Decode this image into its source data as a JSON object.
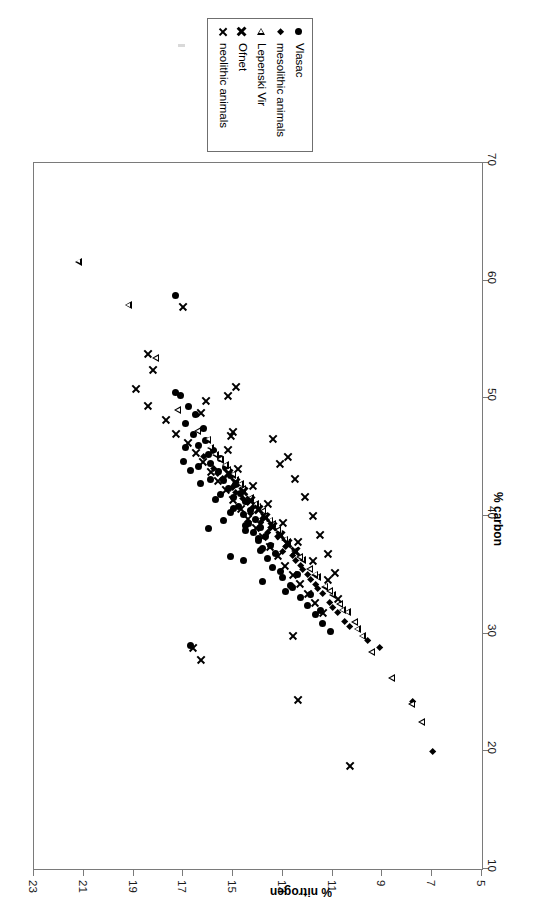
{
  "legend": {
    "position": "top-center-rotated",
    "entries": [
      {
        "label": "Vlasac",
        "marker": "circle-filled"
      },
      {
        "label": "mesolithic animals",
        "marker": "diamond-filled"
      },
      {
        "label": "Lepenski Vir",
        "marker": "triangle-open-left"
      },
      {
        "label": "Ofnet",
        "marker": "x-bold"
      },
      {
        "label": "neolithic animals",
        "marker": "x-thin"
      }
    ]
  },
  "axes": {
    "carbon": {
      "title": "% carbon",
      "ticks": [
        10,
        20,
        30,
        40,
        50,
        60,
        70
      ],
      "min": 10,
      "max": 70
    },
    "nitrogen": {
      "title": "% nitrogen",
      "ticks": [
        5,
        7,
        9,
        11,
        13,
        15,
        17,
        19,
        21,
        23
      ],
      "min": 5,
      "max": 23
    }
  },
  "colors": {
    "marker": "#000000",
    "frame": "#7a7a7a",
    "background": "#ffffff",
    "text": "#000000"
  },
  "chart_data": {
    "type": "scatter",
    "title": "",
    "xlabel": "% carbon",
    "ylabel": "% nitrogen",
    "xlim": [
      10,
      70
    ],
    "ylim": [
      5,
      23
    ],
    "grid": false,
    "orientation": "rotated-90-in-page",
    "legend_position": "top",
    "series": [
      {
        "name": "Vlasac",
        "marker": "circle-filled",
        "points": [
          [
            58.7,
            17.3
          ],
          [
            50.5,
            17.3
          ],
          [
            50.2,
            17.1
          ],
          [
            49.3,
            16.8
          ],
          [
            48.6,
            16.5
          ],
          [
            47.9,
            16.9
          ],
          [
            47.4,
            16.2
          ],
          [
            46.9,
            16.6
          ],
          [
            46.4,
            16.1
          ],
          [
            46.0,
            16.4
          ],
          [
            45.6,
            15.8
          ],
          [
            45.2,
            16.0
          ],
          [
            44.9,
            15.5
          ],
          [
            44.5,
            15.9
          ],
          [
            44.1,
            15.3
          ],
          [
            43.8,
            15.6
          ],
          [
            43.4,
            15.1
          ],
          [
            43.0,
            15.4
          ],
          [
            42.7,
            14.9
          ],
          [
            42.3,
            15.2
          ],
          [
            41.9,
            14.7
          ],
          [
            41.6,
            15.0
          ],
          [
            41.2,
            14.5
          ],
          [
            40.8,
            14.8
          ],
          [
            40.5,
            14.3
          ],
          [
            40.1,
            14.6
          ],
          [
            39.7,
            14.1
          ],
          [
            39.4,
            14.4
          ],
          [
            39.0,
            13.9
          ],
          [
            38.6,
            14.2
          ],
          [
            38.3,
            13.7
          ],
          [
            37.9,
            14.0
          ],
          [
            37.5,
            13.5
          ],
          [
            37.2,
            13.8
          ],
          [
            36.8,
            13.3
          ],
          [
            44.6,
            17.0
          ],
          [
            43.9,
            16.7
          ],
          [
            42.8,
            16.3
          ],
          [
            41.4,
            15.7
          ],
          [
            40.3,
            15.1
          ],
          [
            38.8,
            14.5
          ],
          [
            37.1,
            13.9
          ],
          [
            35.6,
            13.4
          ],
          [
            34.8,
            13.0
          ],
          [
            33.9,
            12.6
          ],
          [
            33.1,
            12.3
          ],
          [
            32.4,
            12.0
          ],
          [
            31.6,
            11.7
          ],
          [
            30.9,
            11.4
          ],
          [
            30.2,
            11.1
          ],
          [
            29.0,
            16.7
          ],
          [
            38.9,
            16.0
          ],
          [
            39.6,
            15.4
          ],
          [
            36.6,
            15.1
          ],
          [
            36.2,
            14.6
          ],
          [
            34.4,
            13.8
          ],
          [
            33.6,
            12.9
          ],
          [
            35.0,
            12.4
          ],
          [
            33.3,
            11.9
          ],
          [
            32.0,
            11.5
          ],
          [
            45.8,
            16.9
          ],
          [
            44.2,
            16.4
          ],
          [
            43.1,
            15.9
          ],
          [
            41.8,
            15.5
          ],
          [
            40.6,
            15.0
          ],
          [
            39.2,
            14.5
          ],
          [
            38.1,
            14.0
          ],
          [
            36.4,
            13.6
          ],
          [
            35.3,
            13.1
          ],
          [
            34.1,
            12.7
          ]
        ]
      },
      {
        "name": "mesolithic animals",
        "marker": "diamond-filled",
        "points": [
          [
            45.0,
            16.2
          ],
          [
            44.0,
            15.8
          ],
          [
            43.2,
            15.4
          ],
          [
            42.4,
            15.0
          ],
          [
            41.5,
            14.6
          ],
          [
            40.7,
            14.2
          ],
          [
            39.8,
            13.8
          ],
          [
            39.0,
            13.5
          ],
          [
            38.2,
            13.2
          ],
          [
            37.4,
            12.9
          ],
          [
            36.6,
            12.6
          ],
          [
            35.8,
            12.3
          ],
          [
            35.0,
            12.0
          ],
          [
            34.2,
            11.7
          ],
          [
            33.4,
            11.4
          ],
          [
            32.6,
            11.1
          ],
          [
            31.8,
            10.8
          ],
          [
            31.0,
            10.5
          ],
          [
            29.4,
            9.6
          ],
          [
            28.8,
            9.1
          ],
          [
            24.2,
            7.8
          ],
          [
            20.0,
            7.0
          ],
          [
            42.0,
            14.9
          ],
          [
            40.2,
            14.3
          ],
          [
            38.6,
            13.6
          ],
          [
            37.0,
            13.0
          ],
          [
            35.4,
            12.2
          ],
          [
            33.8,
            11.6
          ],
          [
            32.2,
            11.0
          ],
          [
            30.6,
            10.3
          ],
          [
            43.6,
            15.6
          ],
          [
            41.1,
            14.4
          ],
          [
            39.4,
            13.9
          ],
          [
            36.2,
            12.5
          ],
          [
            34.6,
            11.9
          ]
        ]
      },
      {
        "name": "Lepenski Vir",
        "marker": "triangle-open-left",
        "points": [
          [
            61.6,
            21.2
          ],
          [
            57.9,
            19.2
          ],
          [
            53.4,
            18.1
          ],
          [
            49.0,
            17.2
          ],
          [
            47.2,
            16.4
          ],
          [
            45.8,
            15.9
          ],
          [
            44.8,
            15.5
          ],
          [
            43.9,
            15.2
          ],
          [
            43.1,
            14.9
          ],
          [
            42.3,
            14.6
          ],
          [
            41.5,
            14.3
          ],
          [
            40.8,
            14.0
          ],
          [
            40.0,
            13.7
          ],
          [
            39.3,
            13.4
          ],
          [
            38.5,
            13.1
          ],
          [
            37.8,
            12.8
          ],
          [
            37.0,
            12.5
          ],
          [
            36.3,
            12.2
          ],
          [
            35.5,
            11.9
          ],
          [
            34.8,
            11.6
          ],
          [
            34.0,
            11.3
          ],
          [
            33.3,
            11.0
          ],
          [
            32.5,
            10.7
          ],
          [
            31.8,
            10.4
          ],
          [
            31.0,
            10.1
          ],
          [
            29.8,
            9.8
          ],
          [
            28.4,
            9.4
          ],
          [
            26.2,
            8.6
          ],
          [
            24.0,
            7.8
          ],
          [
            22.5,
            7.4
          ],
          [
            44.3,
            15.3
          ],
          [
            42.7,
            14.7
          ],
          [
            41.0,
            14.1
          ],
          [
            39.6,
            13.5
          ],
          [
            38.0,
            12.9
          ],
          [
            36.5,
            12.3
          ],
          [
            35.0,
            11.7
          ],
          [
            33.6,
            11.1
          ],
          [
            32.0,
            10.6
          ],
          [
            30.4,
            10.0
          ],
          [
            46.5,
            16.0
          ],
          [
            45.2,
            15.7
          ],
          [
            43.5,
            15.0
          ],
          [
            40.4,
            13.8
          ],
          [
            38.8,
            13.2
          ]
        ]
      },
      {
        "name": "Ofnet",
        "marker": "x-bold",
        "points": [
          [
            43.6,
            15.2
          ],
          [
            42.9,
            14.9
          ],
          [
            42.1,
            14.6
          ],
          [
            41.3,
            14.3
          ],
          [
            40.6,
            14.0
          ],
          [
            39.9,
            13.7
          ],
          [
            39.1,
            13.4
          ],
          [
            38.4,
            13.1
          ],
          [
            37.7,
            12.8
          ],
          [
            37.0,
            12.5
          ]
        ]
      },
      {
        "name": "neolithic animals",
        "marker": "x-thin",
        "points": [
          [
            57.8,
            17.0
          ],
          [
            53.8,
            18.4
          ],
          [
            52.4,
            18.2
          ],
          [
            50.8,
            18.9
          ],
          [
            49.4,
            18.4
          ],
          [
            48.2,
            17.7
          ],
          [
            47.0,
            17.3
          ],
          [
            46.2,
            16.8
          ],
          [
            45.4,
            16.5
          ],
          [
            44.6,
            16.2
          ],
          [
            43.8,
            15.9
          ],
          [
            43.0,
            15.6
          ],
          [
            42.2,
            15.3
          ],
          [
            41.4,
            15.0
          ],
          [
            40.6,
            14.7
          ],
          [
            39.8,
            14.4
          ],
          [
            39.0,
            14.1
          ],
          [
            38.2,
            13.8
          ],
          [
            37.4,
            13.5
          ],
          [
            36.6,
            13.2
          ],
          [
            35.8,
            12.9
          ],
          [
            35.0,
            12.6
          ],
          [
            34.2,
            12.3
          ],
          [
            33.4,
            12.0
          ],
          [
            32.6,
            11.7
          ],
          [
            31.8,
            11.4
          ],
          [
            28.8,
            16.6
          ],
          [
            27.8,
            16.3
          ],
          [
            29.8,
            12.6
          ],
          [
            24.4,
            12.4
          ],
          [
            18.8,
            10.3
          ],
          [
            45.6,
            15.2
          ],
          [
            46.8,
            15.1
          ],
          [
            47.2,
            15.0
          ],
          [
            44.0,
            14.8
          ],
          [
            42.6,
            14.2
          ],
          [
            41.0,
            13.6
          ],
          [
            39.4,
            13.0
          ],
          [
            37.8,
            12.4
          ],
          [
            36.2,
            11.8
          ],
          [
            34.6,
            11.2
          ],
          [
            33.0,
            10.8
          ],
          [
            48.8,
            16.3
          ],
          [
            49.8,
            16.1
          ],
          [
            44.4,
            13.1
          ],
          [
            45.0,
            12.8
          ],
          [
            43.2,
            12.5
          ],
          [
            41.6,
            12.1
          ],
          [
            40.0,
            11.8
          ],
          [
            38.4,
            11.5
          ],
          [
            36.8,
            11.2
          ],
          [
            35.2,
            10.9
          ],
          [
            50.2,
            15.2
          ],
          [
            51.0,
            14.9
          ],
          [
            46.6,
            13.4
          ]
        ]
      }
    ]
  }
}
